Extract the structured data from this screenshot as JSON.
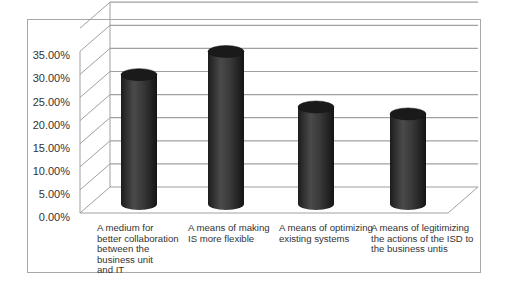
{
  "chart_data": {
    "type": "bar",
    "style": "3d-cylinder",
    "title": "",
    "xlabel": "",
    "ylabel": "",
    "categories": [
      "A medium for better collaboration between the business unit and IT",
      "A means of making IS more flexible",
      "A means of optimizing existing systems",
      "A means of legitimizing the actions of the ISD to the business untis"
    ],
    "category_lines": [
      [
        "A medium for",
        "better collaboration",
        "between the",
        "business unit",
        "and IT"
      ],
      [
        "A means of making",
        "IS more flexible"
      ],
      [
        "A means of optimizing",
        "existing systems"
      ],
      [
        "A means of legitimizing",
        "the actions of the ISD to",
        "the business untis"
      ]
    ],
    "values": [
      0.28,
      0.33,
      0.21,
      0.195
    ],
    "yticks": [
      "0.00%",
      "5.00%",
      "10.00%",
      "15.00%",
      "20.00%",
      "25.00%",
      "30.00%",
      "35.00%"
    ],
    "ylim": [
      0,
      0.4
    ],
    "grid": true,
    "legend": "none",
    "colors": {
      "bar": "#2e2e2e",
      "bar_top": "#1a1a1a",
      "grid": "#a0a0a0",
      "frame": "#a8a8a8",
      "text": "#333333"
    }
  }
}
